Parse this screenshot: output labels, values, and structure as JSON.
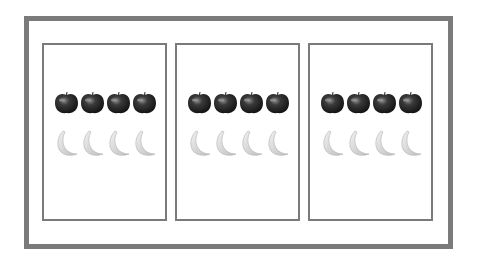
{
  "figure": {
    "groups": [
      {
        "apples": 4,
        "bananas": 4
      },
      {
        "apples": 4,
        "bananas": 4
      },
      {
        "apples": 4,
        "bananas": 4
      }
    ],
    "colors": {
      "border": "#7a7a7a",
      "apple": "#2e2e2e",
      "banana": "#d9d9d9"
    }
  }
}
